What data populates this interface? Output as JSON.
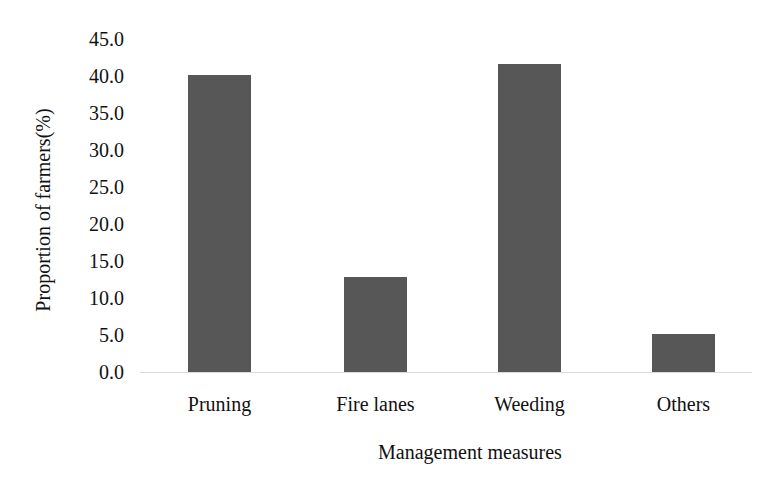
{
  "chart_data": {
    "type": "bar",
    "title": "",
    "xlabel": "Management measures",
    "ylabel": "Proportion of  farmers(%)",
    "categories": [
      "Pruning",
      "Fire lanes",
      "Weeding",
      "Others"
    ],
    "values": [
      40.1,
      12.9,
      41.6,
      5.2
    ],
    "ylim": [
      0,
      45
    ],
    "yticks": [
      "0.0",
      "5.0",
      "10.0",
      "15.0",
      "20.0",
      "25.0",
      "30.0",
      "35.0",
      "40.0",
      "45.0"
    ],
    "grid": false,
    "legend": null,
    "bar_color": "#575757"
  }
}
